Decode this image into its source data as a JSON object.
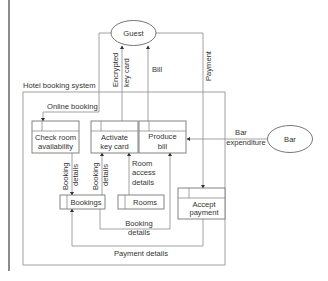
{
  "diagram": {
    "title": "Hotel booking system",
    "external_entities": {
      "guest": "Guest",
      "bar": "Bar"
    },
    "processes": {
      "check_room": [
        "Check room",
        "availability"
      ],
      "activate_key": [
        "Activate",
        "key card"
      ],
      "produce_bill": [
        "Produce",
        "bill"
      ],
      "accept_payment": [
        "Accept",
        "payment"
      ]
    },
    "data_stores": {
      "bookings": "Bookings",
      "rooms": "Rooms"
    },
    "flows": {
      "online_booking": "Online booking",
      "encrypted_key_card": [
        "Encrypted",
        "key card"
      ],
      "bill": "Bill",
      "payment": "Payment",
      "bar_expenditure": [
        "Bar",
        "expenditure"
      ],
      "booking_details_left": [
        "Booking",
        "details"
      ],
      "booking_details_mid": [
        "Booking",
        "details"
      ],
      "room_access_details": [
        "Room",
        "access",
        "details"
      ],
      "booking_details_bottom": [
        "Booking",
        "details"
      ],
      "payment_details": "Payment details"
    },
    "colors": {
      "line": "#8a8a8a",
      "text": "#333333",
      "background": "#ffffff"
    }
  }
}
